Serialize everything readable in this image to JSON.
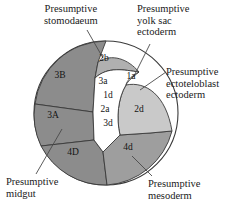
{
  "figure": {
    "type": "fate-map-diagram",
    "shape": "circle",
    "background": "#ffffff"
  },
  "external_labels": [
    {
      "id": "stomodaeum",
      "text": "Presumptive\nstomodaeum",
      "points_to": "2b"
    },
    {
      "id": "yolk-sac-ectoderm",
      "text": "Presumptive\nyolk sac\nectoderm",
      "points_to": "1a"
    },
    {
      "id": "ectoteloblast-ectoderm",
      "text": "Presumptive\nectoteloblast\nectoderm",
      "points_to": "2d"
    },
    {
      "id": "midgut",
      "text": "Presumptive\nmidgut",
      "points_to": "3A"
    },
    {
      "id": "mesoderm",
      "text": "Presumptive\nmesoderm",
      "points_to": "4d"
    }
  ],
  "regions": [
    {
      "id": "3B",
      "label": "3B",
      "fill": "#8c8c8c",
      "x": 60,
      "y": 78
    },
    {
      "id": "3A",
      "label": "3A",
      "fill": "#8c8c8c",
      "x": 53,
      "y": 118
    },
    {
      "id": "4D",
      "label": "4D",
      "fill": "#8c8c8c",
      "x": 73,
      "y": 155
    },
    {
      "id": "4d",
      "label": "4d",
      "fill": "#9e9e9e",
      "x": 128,
      "y": 150
    },
    {
      "id": "2d",
      "label": "2d",
      "fill": "#c9c9c9",
      "x": 139,
      "y": 112
    },
    {
      "id": "2b",
      "label": "2b",
      "fill": "#b0b0b0",
      "x": 104,
      "y": 61
    },
    {
      "id": "1a",
      "label": "1a",
      "fill": "#ffffff",
      "x": 131,
      "y": 79
    },
    {
      "id": "3a",
      "label": "3a",
      "fill": "#ffffff",
      "x": 103,
      "y": 84
    },
    {
      "id": "1d",
      "label": "1d",
      "fill": "#ffffff",
      "x": 108,
      "y": 98
    },
    {
      "id": "2a",
      "label": "2a",
      "fill": "#ffffff",
      "x": 105,
      "y": 112
    },
    {
      "id": "3d",
      "label": "3d",
      "fill": "#ffffff",
      "x": 108,
      "y": 126
    }
  ],
  "colors": {
    "dark_gray": "#8c8c8c",
    "medium_gray": "#9e9e9e",
    "mid_light_gray": "#b0b0b0",
    "light_gray": "#c9c9c9",
    "white": "#ffffff",
    "outline": "#3a3a3a",
    "text": "#1a1a1a"
  }
}
